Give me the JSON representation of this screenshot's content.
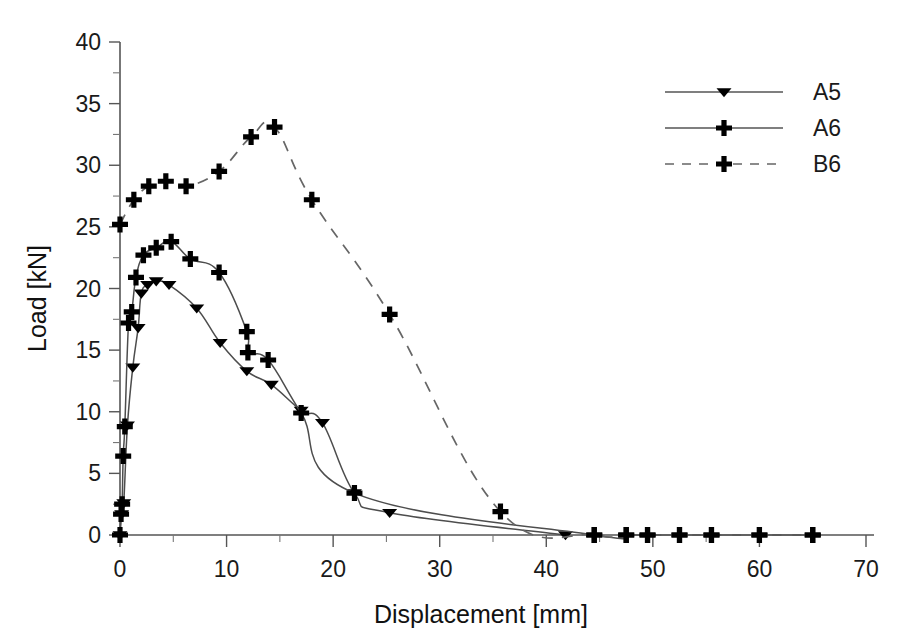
{
  "chart_data": {
    "type": "line",
    "title": "",
    "xlabel": "Displacement [mm]",
    "ylabel": "Load [kN]",
    "xlim": [
      0,
      70
    ],
    "ylim": [
      0,
      40
    ],
    "xticks": [
      0,
      10,
      20,
      30,
      40,
      50,
      60,
      70
    ],
    "xtick_labels": [
      "0",
      "10",
      "20",
      "30",
      "40",
      "50",
      "60",
      "70"
    ],
    "xminor_step": 5,
    "yticks": [
      0,
      5,
      10,
      15,
      20,
      25,
      30,
      35,
      40
    ],
    "ytick_labels": [
      "0",
      "5",
      "10",
      "15",
      "20",
      "25",
      "30",
      "35",
      "40"
    ],
    "yminor_step": 2.5,
    "grid": false,
    "legend_position": "top-right",
    "series": [
      {
        "name": "A5",
        "marker": "triangle-down",
        "line_style": "solid",
        "color": "#000000",
        "points": [
          [
            0.0,
            0.0
          ],
          [
            0.15,
            1.7
          ],
          [
            0.35,
            2.6
          ],
          [
            0.7,
            8.9
          ],
          [
            1.2,
            13.6
          ],
          [
            1.7,
            16.8
          ],
          [
            2.0,
            19.6
          ],
          [
            2.6,
            20.3
          ],
          [
            3.4,
            20.6
          ],
          [
            4.6,
            20.3
          ],
          [
            7.2,
            18.4
          ],
          [
            9.4,
            15.6
          ],
          [
            11.9,
            13.3
          ],
          [
            14.2,
            12.2
          ],
          [
            17.0,
            10.1
          ],
          [
            19.0,
            9.1
          ],
          [
            22.0,
            3.4
          ],
          [
            25.3,
            1.8
          ],
          [
            41.8,
            0.0
          ]
        ]
      },
      {
        "name": "A6",
        "marker": "plus",
        "line_style": "solid",
        "color": "#000000",
        "points": [
          [
            0.0,
            0.0
          ],
          [
            0.1,
            1.7
          ],
          [
            0.2,
            2.5
          ],
          [
            0.3,
            6.4
          ],
          [
            0.45,
            8.8
          ],
          [
            0.8,
            17.2
          ],
          [
            1.1,
            18.1
          ],
          [
            1.5,
            20.9
          ],
          [
            2.2,
            22.7
          ],
          [
            3.4,
            23.3
          ],
          [
            4.8,
            23.8
          ],
          [
            6.6,
            22.4
          ],
          [
            9.3,
            21.3
          ],
          [
            11.9,
            16.5
          ],
          [
            12.0,
            14.8
          ],
          [
            13.9,
            14.2
          ],
          [
            17.0,
            9.9
          ],
          [
            22.0,
            3.4
          ],
          [
            44.5,
            0.0
          ],
          [
            47.5,
            0.0
          ],
          [
            49.5,
            0.0
          ],
          [
            52.5,
            0.0
          ],
          [
            55.5,
            0.0
          ],
          [
            60.0,
            0.0
          ],
          [
            65.0,
            0.0
          ]
        ]
      },
      {
        "name": "B6",
        "marker": "plus",
        "line_style": "dashed",
        "color": "#000000",
        "points": [
          [
            0.0,
            25.2
          ],
          [
            1.3,
            27.2
          ],
          [
            2.7,
            28.3
          ],
          [
            4.3,
            28.7
          ],
          [
            6.2,
            28.3
          ],
          [
            9.3,
            29.5
          ],
          [
            12.3,
            32.3
          ],
          [
            14.5,
            33.1
          ],
          [
            18.0,
            27.2
          ],
          [
            25.3,
            17.9
          ],
          [
            35.7,
            1.9
          ],
          [
            44.5,
            0.0
          ],
          [
            47.5,
            0.0
          ],
          [
            49.5,
            0.0
          ],
          [
            52.5,
            0.0
          ],
          [
            55.5,
            0.0
          ],
          [
            60.0,
            0.0
          ],
          [
            65.0,
            0.0
          ]
        ]
      }
    ],
    "legend": [
      {
        "label": "A5",
        "marker": "triangle-down",
        "line_style": "solid"
      },
      {
        "label": "A6",
        "marker": "plus",
        "line_style": "solid"
      },
      {
        "label": "B6",
        "marker": "plus",
        "line_style": "dashed"
      }
    ]
  }
}
